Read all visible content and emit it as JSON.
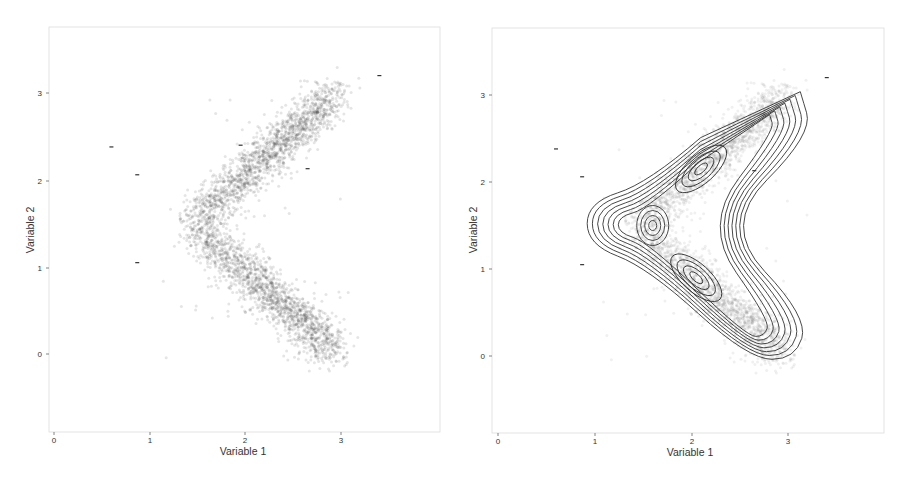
{
  "chart_data": [
    {
      "type": "scatter",
      "title": "",
      "xlabel": "Variable 1",
      "ylabel": "Variable 2",
      "xlim": [
        -0.05,
        4.0
      ],
      "ylim": [
        -0.85,
        3.8
      ],
      "xticks": [
        "0",
        "1",
        "2",
        "3"
      ],
      "yticks": [
        "0",
        "1",
        "2",
        "3"
      ],
      "grid": false,
      "description": "Dense point cloud forming a sideways V (chevron) shape: upper arm from (1.3,1.6) to (3.0,3.0), lower arm from (1.3,1.5) to (2.95,0.0); apex near (1.4,1.5).",
      "clusters": [
        {
          "name": "apex",
          "center": [
            1.55,
            1.5
          ]
        },
        {
          "name": "upper-arm",
          "center": [
            2.1,
            2.1
          ]
        },
        {
          "name": "lower-arm",
          "center": [
            2.15,
            0.9
          ]
        }
      ],
      "outlier_marks": [
        [
          0.6,
          2.38
        ],
        [
          0.87,
          2.06
        ],
        [
          0.87,
          1.05
        ],
        [
          1.95,
          2.4
        ],
        [
          2.65,
          2.13
        ],
        [
          3.4,
          3.2
        ]
      ]
    },
    {
      "type": "scatter",
      "title": "",
      "xlabel": "Variable 1",
      "ylabel": "Variable 2",
      "xlim": [
        -0.05,
        4.0
      ],
      "ylim": [
        -0.85,
        3.8
      ],
      "xticks": [
        "0",
        "1",
        "2",
        "3"
      ],
      "yticks": [
        "0",
        "1",
        "2",
        "3"
      ],
      "grid": false,
      "overlay": "2D kernel density contour lines (about 10 levels)",
      "density_peaks": [
        [
          1.6,
          1.5
        ],
        [
          2.1,
          2.15
        ],
        [
          2.05,
          0.9
        ]
      ],
      "outlier_marks": [
        [
          0.6,
          2.38
        ],
        [
          0.87,
          2.06
        ],
        [
          0.87,
          1.05
        ],
        [
          2.65,
          2.13
        ],
        [
          3.4,
          3.2
        ]
      ]
    }
  ],
  "left": {
    "xlabel": "Variable 1",
    "ylabel": "Variable 2",
    "xticks": [
      "0",
      "1",
      "2",
      "3"
    ],
    "yticks": [
      "0",
      "1",
      "2",
      "3"
    ]
  },
  "right": {
    "xlabel": "Variable 1",
    "ylabel": "Variable 2",
    "xticks": [
      "0",
      "1",
      "2",
      "3"
    ],
    "yticks": [
      "0",
      "1",
      "2",
      "3"
    ]
  }
}
